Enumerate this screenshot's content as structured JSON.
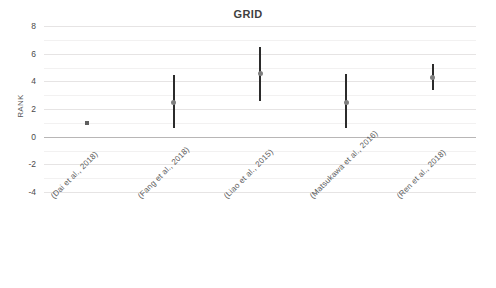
{
  "chart_data": {
    "type": "scatter",
    "title": "GRID",
    "xlabel": "",
    "ylabel": "RANK",
    "ylim": [
      -4,
      8
    ],
    "yticks": [
      8,
      6,
      4,
      2,
      0,
      -2,
      -4
    ],
    "ytick_labels": [
      "8",
      "6",
      "4",
      "2",
      "0",
      "-2",
      "-4"
    ],
    "minor_gridline_step": 1,
    "grid": true,
    "legend": "none",
    "zero_line": 0,
    "categories": [
      "(Dai et al., 2018)",
      "(Fang et al., 2018)",
      "(Liao et al., 2015)",
      "(Matsukawa et al., 2016)",
      "(Ren et al., 2018)"
    ],
    "series": [
      {
        "name": "RANK",
        "values": [
          1.0,
          2.5,
          4.55,
          2.5,
          4.3
        ],
        "error_low": [
          1.0,
          0.6,
          2.55,
          0.6,
          3.4
        ],
        "error_high": [
          1.0,
          4.45,
          6.45,
          4.5,
          5.25
        ],
        "has_error_bar": [
          false,
          true,
          true,
          true,
          true
        ]
      }
    ],
    "colors": {
      "errorbar": "#2b2b2b",
      "marker": "#7f7f7f",
      "gridline": "#eceaea",
      "zero_line": "#b8b6b6",
      "title_text": "#3f3f3f",
      "axis_text": "#4a4a4a",
      "background": "#ffffff"
    }
  }
}
